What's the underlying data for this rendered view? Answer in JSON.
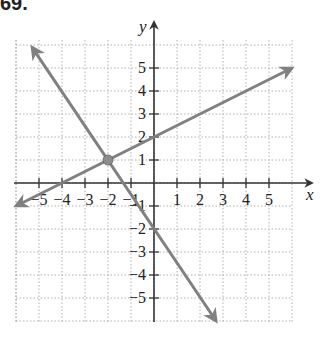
{
  "problem": {
    "number": "69."
  },
  "colors": {
    "line": "#808080",
    "axis": "#333333",
    "grid": "#b0b0b0",
    "point": "#8c8c8c"
  },
  "chart_data": {
    "type": "line",
    "title": "",
    "xlabel": "x",
    "ylabel": "y",
    "xlim": [
      -6,
      6
    ],
    "ylim": [
      -6,
      6
    ],
    "grid": true,
    "x_ticks": [
      -5,
      -4,
      -3,
      -2,
      -1,
      1,
      2,
      3,
      4,
      5
    ],
    "y_ticks": [
      -5,
      -4,
      -3,
      -2,
      -1,
      1,
      2,
      3,
      4,
      5
    ],
    "x_tick_labels": [
      "−5",
      "−4",
      "−3",
      "−2",
      "−1",
      "1",
      "2",
      "3",
      "4",
      "5"
    ],
    "y_tick_labels": [
      "−5",
      "−4",
      "−3",
      "−2",
      "−1",
      "1",
      "2",
      "3",
      "4",
      "5"
    ],
    "series": [
      {
        "name": "line-1",
        "equation": "y = 0.5x + 2",
        "points": [
          [
            -6,
            -1
          ],
          [
            6,
            5
          ]
        ],
        "arrows": "both"
      },
      {
        "name": "line-2",
        "equation": "y = -1.5x - 2",
        "points": [
          [
            -5.3,
            5.9
          ],
          [
            2.7,
            -6
          ]
        ],
        "arrows": "both"
      }
    ],
    "highlighted_points": [
      {
        "x": -2,
        "y": 1,
        "label": "intersection"
      }
    ]
  }
}
